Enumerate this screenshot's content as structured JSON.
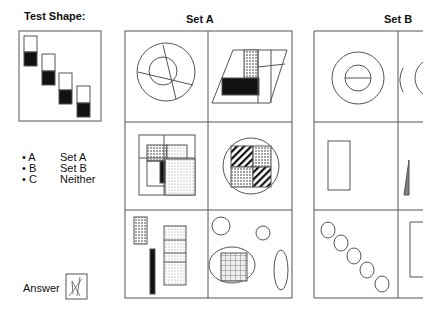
{
  "test_shape": {
    "title": "Test Shape:"
  },
  "set_a": {
    "title": "Set A"
  },
  "set_b": {
    "title": "Set B"
  },
  "options": [
    {
      "key": "A",
      "label": "Set A"
    },
    {
      "key": "B",
      "label": "Set B"
    },
    {
      "key": "C",
      "label": "Neither"
    }
  ],
  "answer": {
    "label": "Answer"
  }
}
